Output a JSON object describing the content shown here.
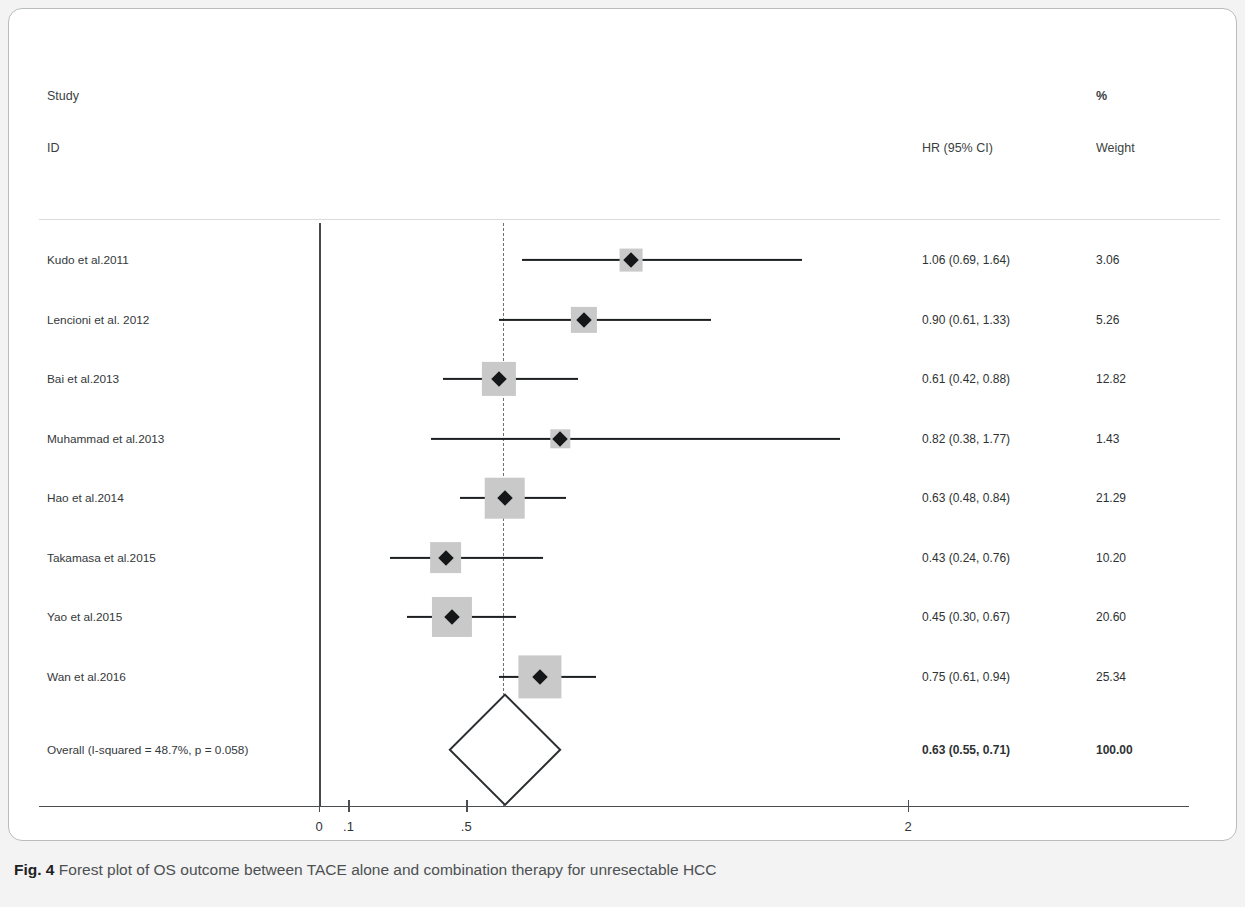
{
  "figure": {
    "caption_label": "Fig. 4",
    "caption_text": "Forest plot of OS outcome between TACE alone and combination therapy for unresectable HCC"
  },
  "headers": {
    "study": "Study",
    "id": "ID",
    "percent": "%",
    "hr": "HR (95% CI)",
    "weight": "Weight"
  },
  "chart_data": {
    "type": "forest",
    "title": "Forest plot of OS outcome between TACE alone and combination therapy for unresectable HCC",
    "xlabel": "",
    "ylabel": "",
    "effect_measure": "HR (95% CI)",
    "null_line": 1,
    "null_line_x_position": 0,
    "pooled_reference_line": 0.63,
    "xlim": [
      0,
      2.9
    ],
    "xticks": [
      0,
      0.1,
      0.5,
      2
    ],
    "xtick_labels": [
      "0",
      ".1",
      ".5",
      "2"
    ],
    "grid": false,
    "heterogeneity": "I-squared = 48.7%, p = 0.058",
    "i_squared": 48.7,
    "p_value": 0.058,
    "studies": [
      {
        "id": "Kudo et al.2011",
        "hr": 1.06,
        "lcl": 0.69,
        "ucl": 1.64,
        "hr_text": "1.06 (0.69, 1.64)",
        "weight": 3.06,
        "weight_text": "3.06"
      },
      {
        "id": "Lencioni et al. 2012",
        "hr": 0.9,
        "lcl": 0.61,
        "ucl": 1.33,
        "hr_text": "0.90 (0.61, 1.33)",
        "weight": 5.26,
        "weight_text": "5.26"
      },
      {
        "id": "Bai et al.2013",
        "hr": 0.61,
        "lcl": 0.42,
        "ucl": 0.88,
        "hr_text": "0.61 (0.42, 0.88)",
        "weight": 12.82,
        "weight_text": "12.82"
      },
      {
        "id": "Muhammad et al.2013",
        "hr": 0.82,
        "lcl": 0.38,
        "ucl": 1.77,
        "hr_text": "0.82 (0.38, 1.77)",
        "weight": 1.43,
        "weight_text": "1.43"
      },
      {
        "id": "Hao et al.2014",
        "hr": 0.63,
        "lcl": 0.48,
        "ucl": 0.84,
        "hr_text": "0.63 (0.48, 0.84)",
        "weight": 21.29,
        "weight_text": "21.29"
      },
      {
        "id": "Takamasa et al.2015",
        "hr": 0.43,
        "lcl": 0.24,
        "ucl": 0.76,
        "hr_text": "0.43 (0.24, 0.76)",
        "weight": 10.2,
        "weight_text": "10.20"
      },
      {
        "id": "Yao et al.2015",
        "hr": 0.45,
        "lcl": 0.3,
        "ucl": 0.67,
        "hr_text": "0.45 (0.30, 0.67)",
        "weight": 20.6,
        "weight_text": "20.60"
      },
      {
        "id": "Wan et al.2016",
        "hr": 0.75,
        "lcl": 0.61,
        "ucl": 0.94,
        "hr_text": "0.75 (0.61, 0.94)",
        "weight": 25.34,
        "weight_text": "25.34"
      }
    ],
    "overall": {
      "id": "Overall  (I-squared = 48.7%, p = 0.058)",
      "hr": 0.63,
      "lcl": 0.55,
      "ucl": 0.71,
      "hr_text": "0.63 (0.55, 0.71)",
      "weight": 100.0,
      "weight_text": "100.00"
    }
  },
  "colors": {
    "marker": "#141618",
    "weight_box": "#c9c9c9",
    "axis": "#4a4e51",
    "panel_border": "#b9bcbe",
    "page_background": "#f3f3f3"
  }
}
